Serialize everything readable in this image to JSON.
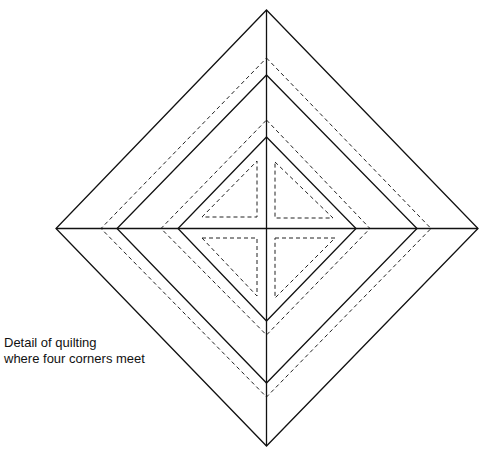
{
  "caption": {
    "line1": "Detail of quilting",
    "line2": "where four corners meet"
  },
  "diagram": {
    "center": [
      266.5,
      228.5
    ],
    "solid_diamonds": [
      {
        "name": "outer",
        "top": 10,
        "right": 478,
        "bottom": 446,
        "left": 56
      },
      {
        "name": "middle",
        "top": 75,
        "right": 417,
        "bottom": 383,
        "left": 117
      },
      {
        "name": "inner",
        "top": 137,
        "right": 356,
        "bottom": 321,
        "left": 178
      }
    ],
    "dashed_diamonds": [
      {
        "name": "quilting-line-outer",
        "top": 58,
        "right": 431,
        "bottom": 397,
        "left": 101
      },
      {
        "name": "quilting-line-inner",
        "top": 120,
        "right": 370,
        "bottom": 335,
        "left": 161
      }
    ],
    "inner_triangles": [
      {
        "name": "top-left",
        "points": [
          [
            202,
            217
          ],
          [
            257,
            161
          ],
          [
            257,
            217
          ]
        ]
      },
      {
        "name": "top-right",
        "points": [
          [
            275,
            162
          ],
          [
            333,
            218
          ],
          [
            275,
            218
          ]
        ]
      },
      {
        "name": "bottom-left",
        "points": [
          [
            202,
            238
          ],
          [
            257,
            238
          ],
          [
            257,
            296
          ]
        ]
      },
      {
        "name": "bottom-right",
        "points": [
          [
            275,
            238
          ],
          [
            335,
            238
          ],
          [
            275,
            298
          ]
        ]
      }
    ],
    "stroke_color": "#111111",
    "background": "#ffffff"
  }
}
